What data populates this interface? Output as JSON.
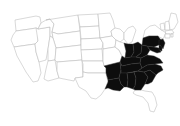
{
  "figure": {
    "kind": "choropleth-map",
    "title": "",
    "subtitle": "",
    "caption": "",
    "region": "Contiguous United States",
    "background_color": "#ffffff",
    "outline_color": "#b9b9b9",
    "highlight_color": "#0d0d0d",
    "width_px": 180,
    "height_px": 126
  },
  "chart_data": {
    "type": "map",
    "title": "",
    "xlabel": "",
    "ylabel": "",
    "legend": [
      {
        "label": "Highlighted",
        "color": "#0d0d0d"
      },
      {
        "label": "Not highlighted",
        "color": "#ffffff"
      }
    ],
    "categories": [
      "Washington",
      "Oregon",
      "California",
      "Nevada",
      "Idaho",
      "Montana",
      "Wyoming",
      "Utah",
      "Arizona",
      "Colorado",
      "New Mexico",
      "North Dakota",
      "South Dakota",
      "Nebraska",
      "Kansas",
      "Oklahoma",
      "Texas",
      "Minnesota",
      "Iowa",
      "Missouri",
      "Arkansas",
      "Louisiana",
      "Wisconsin",
      "Illinois",
      "Michigan",
      "Indiana",
      "Ohio",
      "Kentucky",
      "Tennessee",
      "Mississippi",
      "Alabama",
      "Georgia",
      "Florida",
      "South Carolina",
      "North Carolina",
      "Virginia",
      "West Virginia",
      "Maryland",
      "Delaware",
      "Pennsylvania",
      "New Jersey",
      "New York",
      "Connecticut",
      "Rhode Island",
      "Massachusetts",
      "Vermont",
      "New Hampshire",
      "Maine"
    ],
    "values": [
      0,
      0,
      0,
      0,
      0,
      0,
      0,
      0,
      0,
      0,
      0,
      0,
      0,
      0,
      0,
      0,
      0,
      0,
      0,
      0,
      1,
      1,
      0,
      0,
      0,
      1,
      1,
      1,
      1,
      1,
      1,
      1,
      0,
      1,
      1,
      1,
      1,
      1,
      1,
      1,
      1,
      0,
      0,
      0,
      0,
      0,
      0,
      0
    ],
    "highlighted": [
      "Arkansas",
      "Louisiana",
      "Mississippi",
      "Alabama",
      "Georgia",
      "Tennessee",
      "Kentucky",
      "Indiana",
      "Ohio",
      "West Virginia",
      "Virginia",
      "North Carolina",
      "South Carolina",
      "Maryland",
      "Delaware",
      "Pennsylvania",
      "New Jersey"
    ]
  },
  "states": [
    {
      "name": "Washington",
      "shaded": false,
      "path": "M15,20 L36,16 L40,17 L41,23 L38,29 L36,28 L30,29 L16,31 Z"
    },
    {
      "name": "Oregon",
      "shaded": false,
      "path": "M16,31 L30,29 L36,28 L38,29 L38,41 L35,44 L14,47 L11,40 L13,35 Z"
    },
    {
      "name": "California",
      "shaded": false,
      "path": "M14,47 L35,44 L36,52 L39,62 L41,73 L38,81 L33,82 L26,72 L21,63 L17,56 Z"
    },
    {
      "name": "Nevada",
      "shaded": false,
      "path": "M36,28 L38,29 L50,27 L50,36 L48,49 L46,60 L39,62 L36,52 L35,44 L38,41 Z"
    },
    {
      "name": "Idaho",
      "shaded": false,
      "path": "M38,29 L41,23 L46,20 L50,19 L54,24 L52,32 L53,38 L50,36 L50,27 Z"
    },
    {
      "name": "Montana",
      "shaded": false,
      "path": "M46,20 L78,15 L80,31 L58,34 L52,32 L54,24 L50,19 Z"
    },
    {
      "name": "Wyoming",
      "shaded": false,
      "path": "M53,38 L52,32 L58,34 L80,31 L81,45 L56,48 Z"
    },
    {
      "name": "Utah",
      "shaded": false,
      "path": "M50,36 L53,38 L56,48 L55,60 L48,61 L48,49 Z"
    },
    {
      "name": "Arizona",
      "shaded": false,
      "path": "M48,61 L55,60 L57,71 L59,78 L48,81 L44,79 L46,69 Z"
    },
    {
      "name": "Colorado",
      "shaded": false,
      "path": "M56,48 L81,45 L82,60 L57,62 L55,60 Z"
    },
    {
      "name": "New Mexico",
      "shaded": false,
      "path": "M57,62 L82,60 L83,77 L75,78 L74,81 L59,78 L57,71 Z"
    },
    {
      "name": "North Dakota",
      "shaded": false,
      "path": "M78,15 L98,14 L99,26 L80,27 Z"
    },
    {
      "name": "South Dakota",
      "shaded": false,
      "path": "M80,27 L99,26 L100,38 L81,39 Z"
    },
    {
      "name": "Nebraska",
      "shaded": false,
      "path": "M81,39 L100,38 L103,43 L102,49 L81,50 Z"
    },
    {
      "name": "Kansas",
      "shaded": false,
      "path": "M81,50 L102,49 L103,61 L82,61 Z"
    },
    {
      "name": "Oklahoma",
      "shaded": false,
      "path": "M82,61 L103,61 L104,66 L106,68 L106,73 L88,73 L83,72 L83,64 Z"
    },
    {
      "name": "Texas",
      "shaded": false,
      "path": "M83,72 L88,73 L106,73 L108,82 L105,89 L101,95 L96,99 L91,98 L86,91 L79,87 L75,78 L83,77 Z"
    },
    {
      "name": "Minnesota",
      "shaded": false,
      "path": "M98,14 L110,13 L113,20 L115,28 L111,31 L112,36 L100,38 L99,26 Z"
    },
    {
      "name": "Iowa",
      "shaded": false,
      "path": "M100,38 L112,36 L116,40 L115,47 L103,49 L103,43 L100,38 Z"
    },
    {
      "name": "Missouri",
      "shaded": false,
      "path": "M103,49 L115,47 L119,50 L122,56 L120,62 L112,64 L104,66 L103,61 Z"
    },
    {
      "name": "Arkansas",
      "shaded": true,
      "path": "M104,66 L112,64 L120,62 L121,70 L119,78 L108,80 L106,73 L106,68 Z"
    },
    {
      "name": "Louisiana",
      "shaded": true,
      "path": "M108,80 L119,78 L121,84 L124,87 L120,91 L113,90 L108,88 L105,89 L108,82 Z"
    },
    {
      "name": "Wisconsin",
      "shaded": false,
      "path": "M112,36 L111,31 L115,28 L120,29 L124,33 L124,39 L120,42 L116,40 Z"
    },
    {
      "name": "Illinois",
      "shaded": false,
      "path": "M116,40 L120,42 L124,43 L126,51 L125,58 L122,56 L119,50 L115,47 Z"
    },
    {
      "name": "Michigan",
      "shaded": false,
      "path": "M124,33 L128,28 L133,26 L136,30 L134,36 L132,42 L128,44 L124,39 Z"
    },
    {
      "name": "Indiana",
      "shaded": true,
      "path": "M126,51 L124,43 L128,44 L133,44 L134,52 L131,57 L125,58 Z"
    },
    {
      "name": "Ohio",
      "shaded": true,
      "path": "M133,44 L138,42 L142,45 L141,53 L136,57 L131,57 L134,52 Z"
    },
    {
      "name": "Kentucky",
      "shaded": true,
      "path": "M125,58 L131,57 L136,57 L141,58 L140,63 L131,64 L122,66 L120,62 L122,56 Z"
    },
    {
      "name": "Tennessee",
      "shaded": true,
      "path": "M120,62 L122,66 L131,64 L140,63 L142,68 L138,71 L127,73 L121,73 L121,70 L120,62 Z"
    },
    {
      "name": "Mississippi",
      "shaded": true,
      "path": "M119,78 L121,70 L121,73 L127,73 L128,80 L127,87 L124,87 L121,84 Z"
    },
    {
      "name": "Alabama",
      "shaded": true,
      "path": "M127,73 L134,72 L136,78 L135,86 L133,89 L127,87 L128,80 Z"
    },
    {
      "name": "Georgia",
      "shaded": true,
      "path": "M134,72 L138,71 L144,72 L148,77 L145,84 L141,90 L135,90 L133,89 L135,86 L136,78 Z"
    },
    {
      "name": "Florida",
      "shaded": false,
      "path": "M135,90 L141,90 L145,91 L152,92 L155,97 L157,105 L154,112 L150,111 L148,103 L143,97 L136,95 L133,93 Z"
    },
    {
      "name": "South Carolina",
      "shaded": true,
      "path": "M144,72 L150,70 L156,75 L152,82 L148,84 L145,84 L148,77 Z"
    },
    {
      "name": "North Carolina",
      "shaded": true,
      "path": "M142,68 L147,65 L155,64 L161,66 L163,70 L158,73 L156,75 L150,70 L144,72 L138,71 Z"
    },
    {
      "name": "Virginia",
      "shaded": true,
      "path": "M141,58 L147,55 L154,56 L160,59 L163,63 L155,64 L147,65 L142,68 L140,63 L141,58 Z"
    },
    {
      "name": "West Virginia",
      "shaded": true,
      "path": "M141,53 L142,45 L147,46 L150,50 L147,55 L141,58 L136,57 L141,53 Z"
    },
    {
      "name": "Maryland",
      "shaded": true,
      "path": "M147,46 L154,47 L159,48 L161,52 L157,53 L152,51 L150,50 Z"
    },
    {
      "name": "Delaware",
      "shaded": true,
      "path": "M159,45 L162,46 L162,51 L159,50 Z"
    },
    {
      "name": "Pennsylvania",
      "shaded": true,
      "path": "M142,45 L143,38 L149,36 L158,36 L161,40 L159,45 L154,47 L147,46 Z"
    },
    {
      "name": "New Jersey",
      "shaded": true,
      "path": "M159,40 L163,39 L165,43 L163,49 L161,46 L159,45 Z"
    },
    {
      "name": "New York",
      "shaded": false,
      "path": "M143,38 L145,30 L150,26 L155,25 L160,29 L166,33 L163,39 L158,36 L149,36 Z"
    },
    {
      "name": "Vermont",
      "shaded": false,
      "path": "M160,24 L164,23 L165,30 L161,30 Z"
    },
    {
      "name": "New Hampshire",
      "shaded": false,
      "path": "M165,22 L169,21 L170,30 L166,30 L165,30 Z"
    },
    {
      "name": "Maine",
      "shaded": false,
      "path": "M169,21 L171,13 L176,14 L178,22 L174,29 L170,30 Z"
    },
    {
      "name": "Massachusetts",
      "shaded": false,
      "path": "M165,31 L172,30 L174,33 L170,34 L166,34 Z"
    },
    {
      "name": "Connecticut",
      "shaded": false,
      "path": "M165,34 L170,34 L170,38 L165,38 Z"
    },
    {
      "name": "Rhode Island",
      "shaded": false,
      "path": "M171,34 L173,34 L173,37 L171,37 Z"
    }
  ]
}
